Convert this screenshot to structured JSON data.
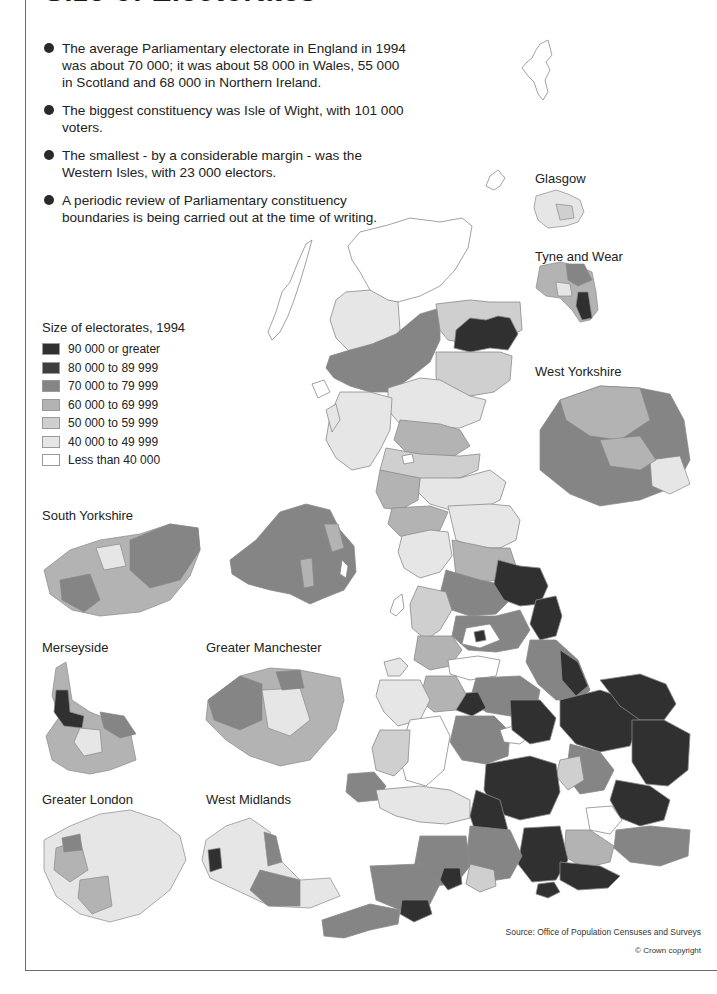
{
  "header": {
    "title": "Size of Electorates"
  },
  "bullets": [
    "The average Parliamentary electorate in England in 1994 was about 70 000; it was about 58 000 in Wales, 55 000 in Scotland and 68 000 in Northern Ireland.",
    "The biggest constituency was Isle of Wight, with 101 000 voters.",
    "The smallest - by a considerable margin - was the Western Isles, with 23 000 electors.",
    "A periodic review of Parliamentary constituency boundaries is being carried out at the time of writing."
  ],
  "legend": {
    "title": "Size of electorates, 1994",
    "items": [
      {
        "label": "90 000 or greater",
        "color": "#303030"
      },
      {
        "label": "80 000 to 89 999",
        "color": "#3e3e3e"
      },
      {
        "label": "70 000 to 79 999",
        "color": "#858585"
      },
      {
        "label": "60 000 to 69 999",
        "color": "#b3b3b3"
      },
      {
        "label": "50 000 to 59 999",
        "color": "#cfcfcf"
      },
      {
        "label": "40 000 to 49 999",
        "color": "#e6e6e6"
      },
      {
        "label": "Less than 40 000",
        "color": "#ffffff"
      }
    ]
  },
  "insets": {
    "glasgow": "Glasgow",
    "tyne_and_wear": "Tyne and Wear",
    "west_yorkshire": "West Yorkshire",
    "south_yorkshire": "South Yorkshire",
    "merseyside": "Merseyside",
    "greater_manchester": "Greater Manchester",
    "greater_london": "Greater London",
    "west_midlands": "West Midlands"
  },
  "footer": {
    "source": "Source: Office of Population Censuses and Surveys",
    "copyright": "© Crown copyright"
  },
  "map_facts": {
    "average_electorate_england_1994": 70000,
    "average_electorate_wales_1994": 58000,
    "average_electorate_scotland_1994": 55000,
    "average_electorate_northern_ireland_1994": 68000,
    "largest_constituency": {
      "name": "Isle of Wight",
      "electors": 101000
    },
    "smallest_constituency": {
      "name": "Western Isles",
      "electors": 23000
    }
  }
}
